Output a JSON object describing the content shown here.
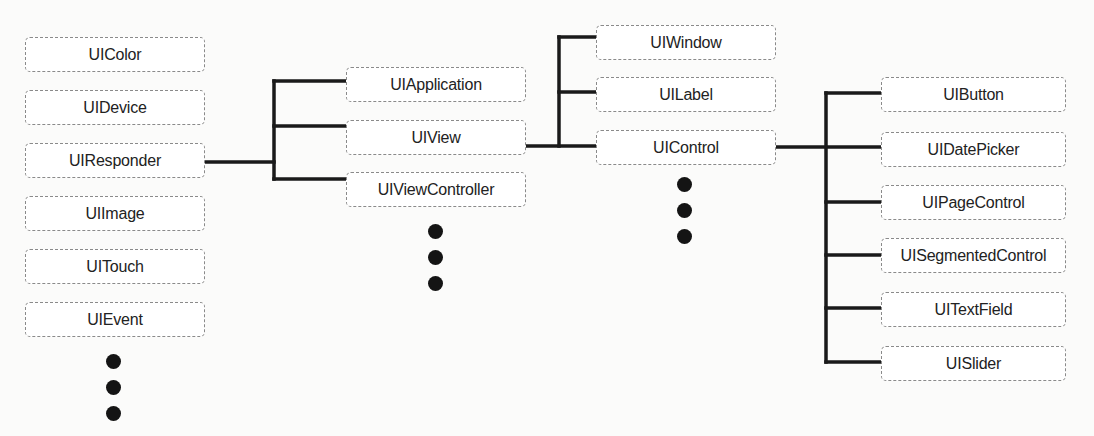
{
  "diagram": {
    "title": "",
    "columns": [
      {
        "name": "root-classes",
        "nodes": [
          "UIColor",
          "UIDevice",
          "UIResponder",
          "UIImage",
          "UITouch",
          "UIEvent"
        ],
        "has_more": true
      },
      {
        "name": "uiresponder-subclasses",
        "parent": "UIResponder",
        "nodes": [
          "UIApplication",
          "UIView",
          "UIViewController"
        ],
        "has_more": true
      },
      {
        "name": "uiview-subclasses",
        "parent": "UIView",
        "nodes": [
          "UIWindow",
          "UILabel",
          "UIControl"
        ],
        "has_more": true
      },
      {
        "name": "uicontrol-subclasses",
        "parent": "UIControl",
        "nodes": [
          "UIButton",
          "UIDatePicker",
          "UIPageControl",
          "UISegmentedControl",
          "UITextField",
          "UISlider"
        ],
        "has_more": false
      }
    ],
    "colors": {
      "line": "#1a1a1a",
      "box_border": "#8a8a8a",
      "box_fill": "#ffffff",
      "background": "#fbfbfa",
      "dot": "#141414"
    }
  }
}
